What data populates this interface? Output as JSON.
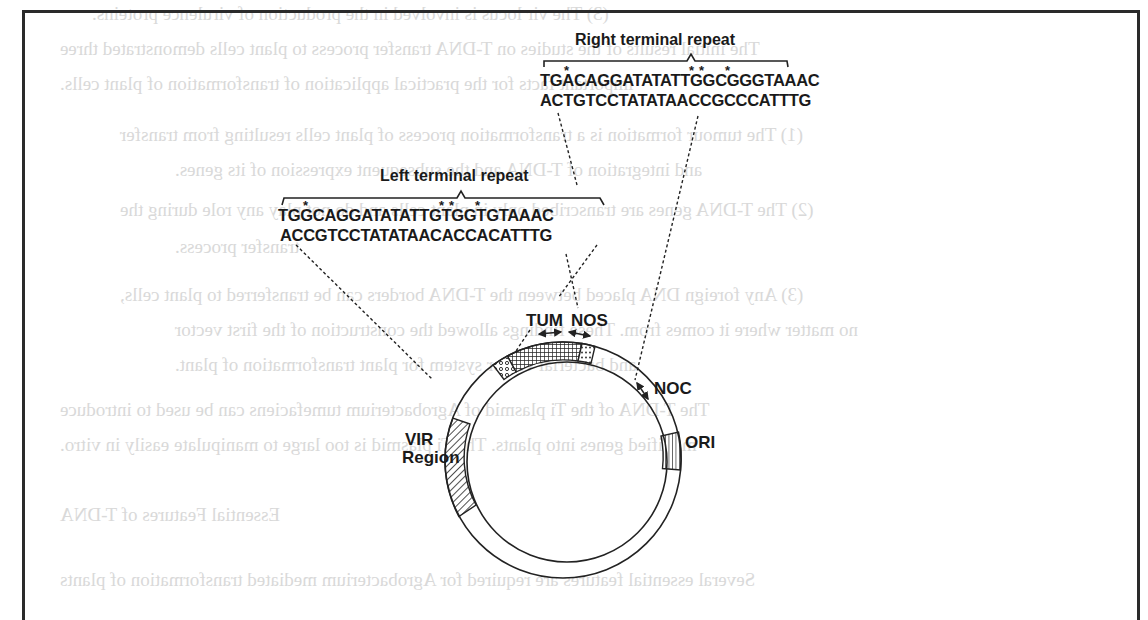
{
  "figure": {
    "right_terminal_repeat": {
      "title": "Right terminal repeat",
      "top_strand": "TGACAGGATATATTGGCGGGTAAAC",
      "bottom_strand": "ACTGTCCTATATAACCGCCCATTTG",
      "marked_positions": [
        3,
        16,
        17,
        20
      ]
    },
    "left_terminal_repeat": {
      "title": "Left terminal repeat",
      "top_strand": "TGGCAGGATATATTGTGGTGTAAAC",
      "bottom_strand": "ACCGTCCTATATAACACCACATTTG",
      "marked_positions": [
        3,
        16,
        17,
        20
      ]
    },
    "plasmid_labels": {
      "tum": "TUM",
      "nos": "NOS",
      "noc": "NOC",
      "ori": "ORI",
      "vir_line1": "VIR",
      "vir_line2": "Region"
    },
    "star_symbol": "*"
  },
  "bleed_through_text": [
    "(3)  The vir locus is involved in the production of virulence proteins.",
    "The initial results of the studies on T-DNA transfer process to plant cells demonstrated three",
    "important facts for the practical application of transformation of plant cells.",
    "(1)  The tumour formation is a transformation process of plant cells resulting from transfer",
    "and integration of T-DNA and the subsequent expression of its genes.",
    "(2)  The T-DNA genes are transcribed only in plant cells and do not play any role during the",
    "transfer process.",
    "(3)  Any foreign DNA placed between the T-DNA borders can be transferred to plant cells,",
    "no matter where it comes from. These findings allowed the construction of the first vector",
    "and bacterial vector system for plant transformation of plant.",
    "The T-DNA of the Ti plasmid of Agrobacterium tumefaciens can be used to introduce",
    "modified genes into plants. The Ti plasmid is too large to manipulate easily in vitro.",
    "Essential Features of T-DNA",
    "Several essential features are required for Agrobacterium mediated transformation of plants"
  ]
}
